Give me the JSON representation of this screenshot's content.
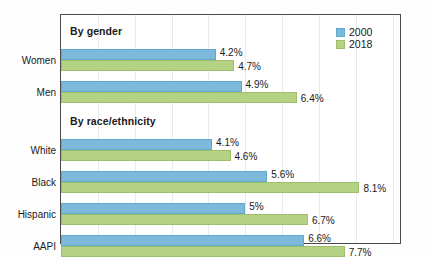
{
  "chart_data": {
    "type": "bar",
    "orientation": "horizontal",
    "title": "",
    "xlabel": "",
    "ylabel": "",
    "xlim": [
      0,
      9.2
    ],
    "grid": true,
    "legend_position": "top-right",
    "value_suffix": "%",
    "series": [
      {
        "name": "2000",
        "color": "#7db9db"
      },
      {
        "name": "2018",
        "color": "#b5d183"
      }
    ],
    "sections": [
      {
        "header": "By gender",
        "categories": [
          {
            "label": "Women",
            "values": [
              4.2,
              4.7
            ],
            "labels": [
              "4.2%",
              "4.7%"
            ]
          },
          {
            "label": "Men",
            "values": [
              4.9,
              6.4
            ],
            "labels": [
              "4.9%",
              "6.4%"
            ]
          }
        ]
      },
      {
        "header": "By race/ethnicity",
        "categories": [
          {
            "label": "White",
            "values": [
              4.1,
              4.6
            ],
            "labels": [
              "4.1%",
              "4.6%"
            ]
          },
          {
            "label": "Black",
            "values": [
              5.6,
              8.1
            ],
            "labels": [
              "5.6%",
              "8.1%"
            ]
          },
          {
            "label": "Hispanic",
            "values": [
              5.0,
              6.7
            ],
            "labels": [
              "5%",
              "6.7%"
            ]
          },
          {
            "label": "AAPI",
            "values": [
              6.6,
              7.7
            ],
            "labels": [
              "6.6%",
              "7.7%"
            ]
          }
        ]
      }
    ]
  },
  "legend": {
    "items": [
      {
        "label": "2000",
        "series": "s2000"
      },
      {
        "label": "2018",
        "series": "s2018"
      }
    ]
  }
}
